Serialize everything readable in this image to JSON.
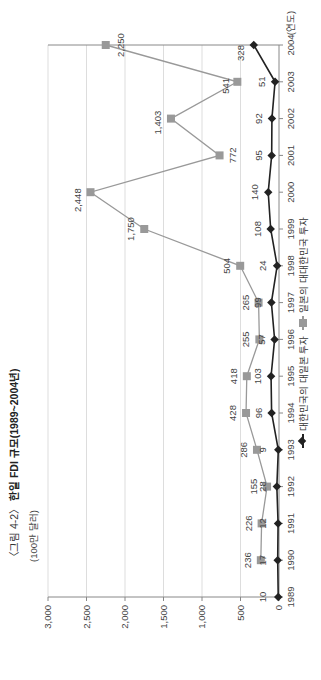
{
  "title": {
    "prefix": "〈그림 4-2〉",
    "main": "한일 FDI 규모(1989~2004년)"
  },
  "unit_label": "(100만 달러)",
  "x_unit_label": "(연도)",
  "legend": {
    "korea_to_japan": "대한민국의 대일본 투자",
    "japan_to_korea": "일본의 대대한민국 투자"
  },
  "colors": {
    "korea_series": "#222222",
    "japan_series": "#999999",
    "grid": "#dddddd",
    "axis": "#888888"
  },
  "chart_data": {
    "type": "line",
    "title": "〈그림 4-2〉 한일 FDI 규모(1989~2004년)",
    "xlabel": "(연도)",
    "ylabel": "(100만 달러)",
    "ylim": [
      0,
      3000
    ],
    "yticks": [
      "0",
      "500",
      "1,000",
      "1,500",
      "2,000",
      "2,500",
      "3,000"
    ],
    "grid": true,
    "legend_position": "bottom",
    "orientation_note": "figure is rotated 90° counter-clockwise on the page",
    "categories": [
      "1989",
      "1990",
      "1991",
      "1992",
      "1993",
      "1994",
      "1995",
      "1996",
      "1997",
      "1998",
      "1999",
      "2000",
      "2001",
      "2002",
      "2003",
      "2004"
    ],
    "series": [
      {
        "name": "대한민국의 대일본 투자",
        "marker": "diamond",
        "values": [
          10,
          17,
          12,
          28,
          9,
          96,
          103,
          57,
          99,
          24,
          108,
          140,
          95,
          92,
          51,
          328
        ],
        "labels": [
          "10",
          "17",
          "12",
          "28",
          "9",
          "96",
          "103",
          "57",
          "99",
          "24",
          "108",
          "140",
          "95",
          "92",
          "51",
          "328"
        ]
      },
      {
        "name": "일본의 대대한민국 투자",
        "marker": "square",
        "values": [
          null,
          236,
          226,
          155,
          286,
          428,
          418,
          255,
          265,
          504,
          1750,
          2448,
          772,
          1403,
          541,
          2250
        ],
        "labels": [
          null,
          "236",
          "226",
          "155",
          "286",
          "428",
          "418",
          "255",
          "265",
          "504",
          "1,750",
          "2,448",
          "772",
          "1,403",
          "541",
          "2,250"
        ]
      }
    ]
  }
}
